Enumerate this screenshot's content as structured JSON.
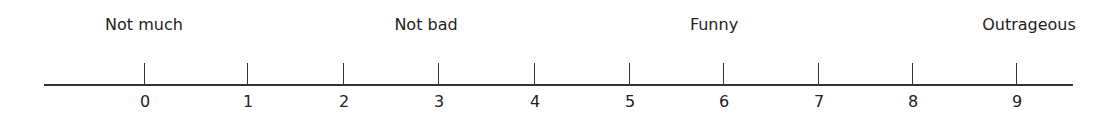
{
  "scale": {
    "anchors": [
      {
        "text": "Not much",
        "x": 144
      },
      {
        "text": "Not bad",
        "x": 426
      },
      {
        "text": "Funny",
        "x": 714
      },
      {
        "text": "Outrageous",
        "x": 1029
      }
    ],
    "ticks": [
      {
        "label": "0",
        "x": 144
      },
      {
        "label": "1",
        "x": 247
      },
      {
        "label": "2",
        "x": 343
      },
      {
        "label": "3",
        "x": 438
      },
      {
        "label": "4",
        "x": 534
      },
      {
        "label": "5",
        "x": 629
      },
      {
        "label": "6",
        "x": 723
      },
      {
        "label": "7",
        "x": 818
      },
      {
        "label": "8",
        "x": 912
      },
      {
        "label": "9",
        "x": 1016
      }
    ]
  }
}
